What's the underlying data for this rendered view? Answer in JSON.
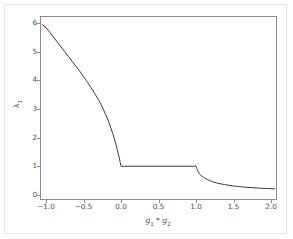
{
  "figure": {
    "background_color": "#ffffff",
    "border_color": "#e3e3e3",
    "axes_color": "#8d8d8d",
    "line_color": "#3b3b3b",
    "tick_text_color": "#4d4d4d"
  },
  "axis": {
    "xlabel_base1": "g",
    "xlabel_sub1": "1",
    "xlabel_sep": " * ",
    "xlabel_base2": "g",
    "xlabel_sub2": "2",
    "ylabel_base": "λ",
    "ylabel_sub": "1"
  },
  "chart_data": {
    "type": "line",
    "title": "",
    "xlabel": "g₁ * g₂",
    "ylabel": "λ₁",
    "xlim": [
      -1.08,
      2.08
    ],
    "ylim": [
      -0.18,
      6.25
    ],
    "grid": false,
    "legend": null,
    "xticks": [
      -1.0,
      -0.5,
      0.0,
      0.5,
      1.0,
      1.5,
      2.0
    ],
    "xticklabels": [
      "−1.0",
      "−0.5",
      "0.0",
      "0.5",
      "1.0",
      "1.5",
      "2.0"
    ],
    "yticks": [
      0,
      1,
      2,
      3,
      4,
      5,
      6
    ],
    "yticklabels": [
      "0",
      "1",
      "2",
      "3",
      "4",
      "5",
      "6"
    ],
    "series": [
      {
        "name": "lambda_1",
        "color": "#3b3b3b",
        "linewidth": 1.0,
        "x": [
          -1.05,
          -1.0,
          -0.95,
          -0.9,
          -0.85,
          -0.8,
          -0.75,
          -0.7,
          -0.65,
          -0.6,
          -0.55,
          -0.5,
          -0.45,
          -0.4,
          -0.35,
          -0.3,
          -0.25,
          -0.2,
          -0.17,
          -0.14,
          -0.11,
          -0.09,
          -0.07,
          -0.05,
          -0.04,
          -0.03,
          -0.02,
          -0.01,
          0.0,
          0.1,
          0.2,
          0.3,
          0.4,
          0.5,
          0.6,
          0.7,
          0.8,
          0.9,
          0.97,
          1.0,
          1.01,
          1.02,
          1.03,
          1.05,
          1.07,
          1.1,
          1.14,
          1.18,
          1.22,
          1.27,
          1.32,
          1.38,
          1.44,
          1.5,
          1.57,
          1.64,
          1.72,
          1.8,
          1.88,
          1.95,
          2.0,
          2.05
        ],
        "y": [
          5.95,
          5.85,
          5.68,
          5.51,
          5.34,
          5.17,
          5.0,
          4.83,
          4.66,
          4.49,
          4.32,
          4.13,
          3.95,
          3.75,
          3.54,
          3.32,
          3.07,
          2.78,
          2.59,
          2.38,
          2.14,
          1.97,
          1.79,
          1.58,
          1.47,
          1.36,
          1.25,
          1.13,
          1.0,
          1.0,
          1.0,
          1.0,
          1.0,
          1.0,
          1.0,
          1.0,
          1.0,
          1.0,
          1.0,
          1.0,
          0.93,
          0.86,
          0.8,
          0.72,
          0.67,
          0.61,
          0.55,
          0.5,
          0.46,
          0.42,
          0.39,
          0.36,
          0.335,
          0.31,
          0.29,
          0.273,
          0.257,
          0.243,
          0.23,
          0.22,
          0.215,
          0.21
        ]
      }
    ]
  }
}
